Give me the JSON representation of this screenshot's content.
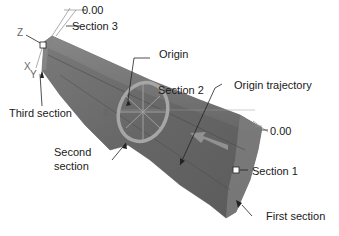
{
  "diagram": {
    "type": "cad-swept-solid",
    "colors": {
      "solid_fill": "#6e6e6e",
      "solid_dark": "#555555",
      "solid_light": "#8a8a8a",
      "ring": "#a8a8a8",
      "leader": "#222222",
      "axis": "#888888"
    },
    "labels": {
      "section3_value": "0.00",
      "section3": "Section 3",
      "origin": "Origin",
      "section2": "Section 2",
      "origin_trajectory": "Origin trajectory",
      "third_section": "Third section",
      "second_section_line1": "Second",
      "second_section_line2": "section",
      "section1_value": "0.00",
      "section1": "Section 1",
      "first_section": "First section"
    },
    "axes": {
      "z": "Z",
      "x_left": "X",
      "y_left": "Y",
      "x_mid": "X"
    }
  }
}
